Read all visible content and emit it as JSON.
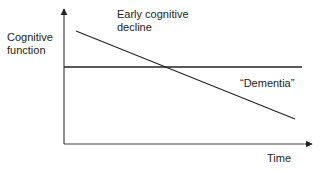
{
  "diagram": {
    "y_axis_label_line1": "Cognitive",
    "y_axis_label_line2": "function",
    "x_axis_label": "Time",
    "declining_line_label_line1": "Early cognitive",
    "declining_line_label_line2": "decline",
    "threshold_line_label": "“Dementia”",
    "colors": {
      "line": "#222222",
      "axis": "#444444",
      "background": "#ffffff"
    }
  }
}
